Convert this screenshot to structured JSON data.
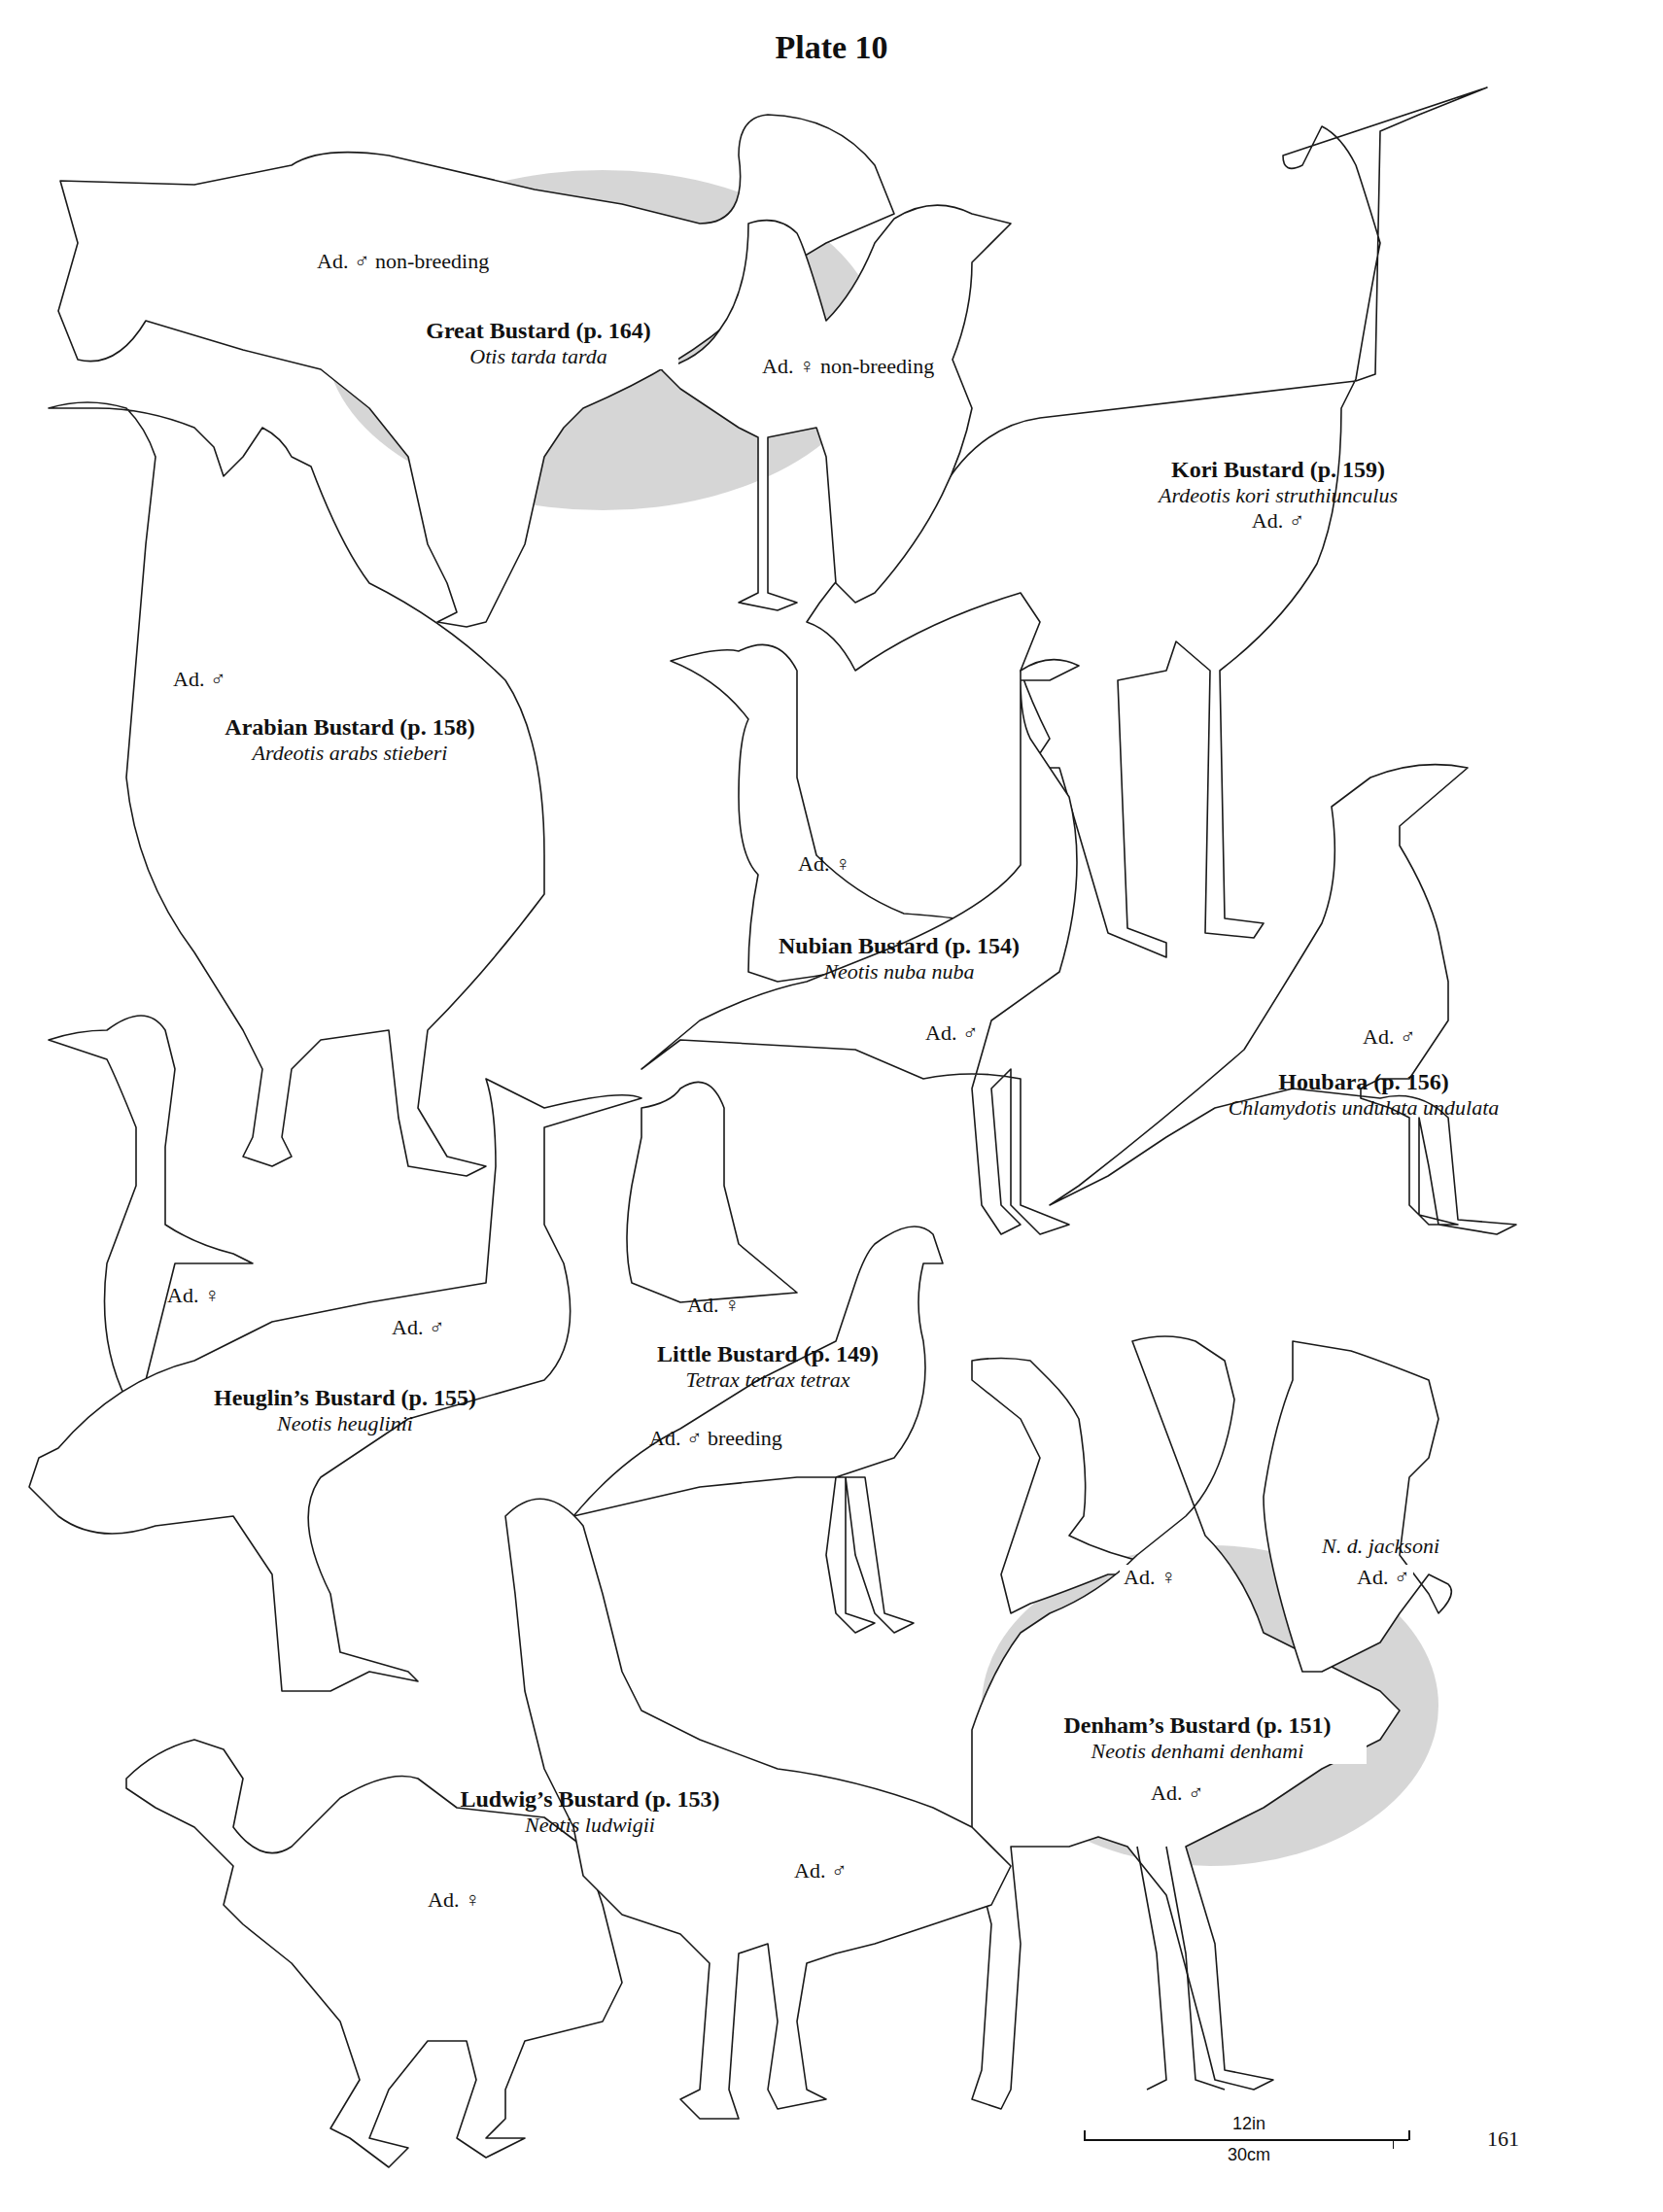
{
  "page": {
    "title": "Plate 10",
    "page_number": "161",
    "scale_bar": {
      "imperial": "12in",
      "metric": "30cm"
    }
  },
  "species": [
    {
      "id": "great-bustard",
      "name": "Great Bustard (p. 164)",
      "scientific": "Otis tarda tarda",
      "labels": [
        "Ad. ♂ non-breeding",
        "Ad. ♀ non-breeding"
      ]
    },
    {
      "id": "kori-bustard",
      "name": "Kori Bustard (p. 159)",
      "scientific": "Ardeotis kori struthiunculus",
      "labels": [
        "Ad. ♂"
      ]
    },
    {
      "id": "arabian-bustard",
      "name": "Arabian Bustard (p. 158)",
      "scientific": "Ardeotis arabs stieberi",
      "labels": [
        "Ad. ♂"
      ]
    },
    {
      "id": "nubian-bustard",
      "name": "Nubian Bustard (p. 154)",
      "scientific": "Neotis nuba nuba",
      "labels": [
        "Ad. ♀",
        "Ad. ♂"
      ]
    },
    {
      "id": "houbara",
      "name": "Houbara (p. 156)",
      "scientific": "Chlamydotis undulata undulata",
      "labels": [
        "Ad. ♂"
      ]
    },
    {
      "id": "heuglins-bustard",
      "name": "Heuglin’s Bustard (p. 155)",
      "scientific": "Neotis heuglinii",
      "labels": [
        "Ad. ♀",
        "Ad. ♂"
      ]
    },
    {
      "id": "little-bustard",
      "name": "Little Bustard (p. 149)",
      "scientific": "Tetrax tetrax tetrax",
      "labels": [
        "Ad. ♀",
        "Ad. ♂ breeding"
      ]
    },
    {
      "id": "denhams-bustard",
      "name": "Denham’s Bustard (p. 151)",
      "scientific": "Neotis denhami denhami",
      "labels": [
        "Ad. ♀",
        "Ad. ♂",
        "N. d. jacksoni",
        "Ad. ♂"
      ]
    },
    {
      "id": "ludwigs-bustard",
      "name": "Ludwig’s Bustard (p. 153)",
      "scientific": "Neotis ludwigii",
      "labels": [
        "Ad. ♀",
        "Ad. ♂"
      ]
    }
  ]
}
